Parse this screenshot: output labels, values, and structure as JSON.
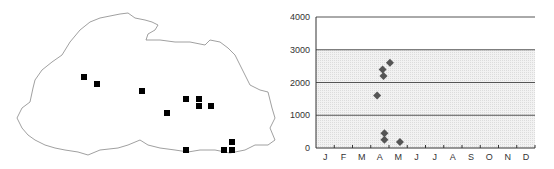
{
  "map": {
    "title": "Distribution map",
    "markers": [
      [
        84,
        77
      ],
      [
        97,
        84
      ],
      [
        142,
        91
      ],
      [
        186,
        99
      ],
      [
        199,
        99
      ],
      [
        199,
        106
      ],
      [
        211,
        106
      ],
      [
        167,
        113
      ],
      [
        232,
        142
      ],
      [
        186,
        150
      ],
      [
        224,
        150
      ],
      [
        232,
        150
      ]
    ]
  },
  "chart_data": {
    "type": "scatter",
    "title": "",
    "xlabel": "",
    "ylabel": "",
    "categories": [
      "J",
      "F",
      "M",
      "A",
      "M",
      "J",
      "J",
      "A",
      "S",
      "O",
      "N",
      "D"
    ],
    "ylim": [
      0,
      4000
    ],
    "yticks": [
      0,
      1000,
      2000,
      3000,
      4000
    ],
    "grid": true,
    "legend": null,
    "series": [
      {
        "name": "records",
        "marker": "diamond",
        "color": "#555555",
        "points": [
          {
            "month": 3.85,
            "value": 1600
          },
          {
            "month": 4.15,
            "value": 2400
          },
          {
            "month": 4.2,
            "value": 2200
          },
          {
            "month": 4.55,
            "value": 2600
          },
          {
            "month": 4.25,
            "value": 450
          },
          {
            "month": 4.25,
            "value": 250
          },
          {
            "month": 5.1,
            "value": 180
          }
        ]
      }
    ]
  }
}
